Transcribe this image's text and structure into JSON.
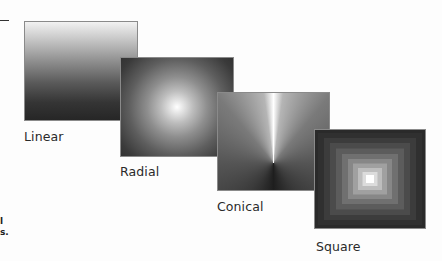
{
  "figure": {
    "panels": [
      {
        "id": "linear",
        "label": "Linear"
      },
      {
        "id": "radial",
        "label": "Radial"
      },
      {
        "id": "conical",
        "label": "Conical"
      },
      {
        "id": "square",
        "label": "Square"
      }
    ],
    "clipped_text_fragments": [
      "l",
      "s."
    ],
    "colors": {
      "light": "#ffffff",
      "dark": "#222222",
      "label_text": "#2a2a2a"
    }
  }
}
